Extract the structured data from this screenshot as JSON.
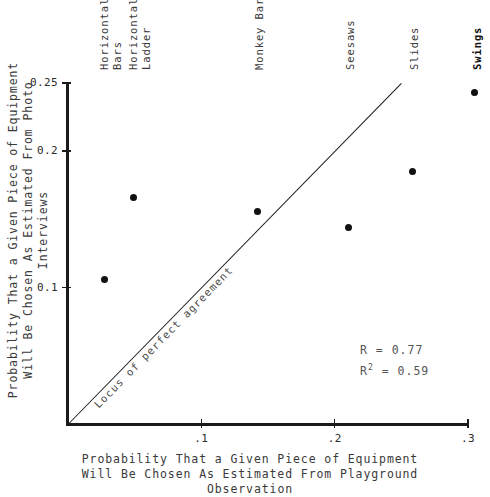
{
  "chart_data": {
    "type": "scatter",
    "title": "",
    "xlabel": "Probability That a Given Piece of Equipment Will Be Chosen As Estimated From Playground Observation",
    "ylabel": "Probability That a Given Piece of Equipment Will Be Chosen As Estimated From Photo Interviews",
    "xlim": [
      0,
      0.3
    ],
    "ylim": [
      0,
      0.25
    ],
    "grid": false,
    "legend": "none",
    "x_ticks": [
      {
        "value": 0.1,
        "label": ".1"
      },
      {
        "value": 0.2,
        "label": ".2"
      },
      {
        "value": 0.3,
        "label": ".3"
      }
    ],
    "y_ticks": [
      {
        "value": 0.1,
        "label": "0.1"
      },
      {
        "value": 0.2,
        "label": "0.2"
      },
      {
        "value": 0.25,
        "label": "0.25"
      }
    ],
    "points": [
      {
        "label": "Horizontal Bars",
        "label_lines": [
          "Horizontal",
          "Bars"
        ],
        "x": 0.027,
        "y": 0.106,
        "bold": false
      },
      {
        "label": "Horizontal Ladder",
        "label_lines": [
          "Horizontal",
          "Ladder"
        ],
        "x": 0.049,
        "y": 0.166,
        "bold": false
      },
      {
        "label": "Monkey Bars",
        "label_lines": [
          "Monkey Bars"
        ],
        "x": 0.142,
        "y": 0.156,
        "bold": false
      },
      {
        "label": "Seesaws",
        "label_lines": [
          "Seesaws"
        ],
        "x": 0.21,
        "y": 0.144,
        "bold": false
      },
      {
        "label": "Slides",
        "label_lines": [
          "Slides"
        ],
        "x": 0.258,
        "y": 0.185,
        "bold": false
      },
      {
        "label": "Swings",
        "label_lines": [
          "Swings"
        ],
        "x": 0.305,
        "y": 0.243,
        "bold": true
      }
    ],
    "reference_line": {
      "label": "Locus of perfect agreement",
      "from": [
        0,
        0
      ],
      "to": [
        0.25,
        0.25
      ]
    },
    "annotations": {
      "r_label": "R = 0.77",
      "r2_prefix": "R",
      "r2_exponent": "2",
      "r2_suffix": " = 0.59"
    }
  },
  "axis_titles": {
    "x_line1": "Probability That a Given Piece of Equipment",
    "x_line2": "Will Be Chosen As Estimated From Playground Observation",
    "y_line1": "Probability That a Given Piece of Equipment",
    "y_line2": "Will Be Chosen As Estimated From Photo Interviews"
  }
}
